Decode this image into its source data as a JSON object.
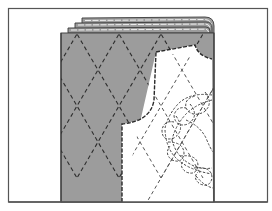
{
  "figure": {
    "title": "",
    "colors": {
      "background": "#ffffff",
      "frame_border": "#555555",
      "fabric": "#9c9c9c",
      "pattern_piece": "#ffffff",
      "stitch_lines": "#2e2e2e"
    },
    "elements": [
      {
        "name": "outer-frame"
      },
      {
        "name": "quilted-fabric",
        "pattern": "diamond-lattice"
      },
      {
        "name": "folded-layers",
        "count": 4
      },
      {
        "name": "pattern-piece",
        "shape": "bodice-front"
      },
      {
        "name": "cable-stitch-motif"
      }
    ]
  }
}
